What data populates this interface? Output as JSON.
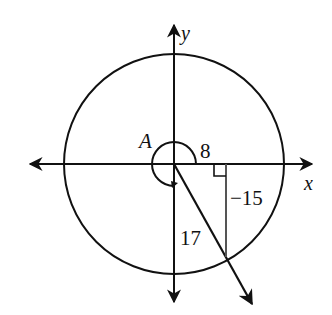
{
  "diagram": {
    "type": "reference-angle-circle",
    "labels": {
      "y_axis": "y",
      "x_axis": "x",
      "angle": "A",
      "adjacent": "8",
      "opposite": "−15",
      "hypotenuse": "17"
    },
    "colors": {
      "stroke": "#111111",
      "triangle": "#555555",
      "background": "#ffffff"
    }
  }
}
